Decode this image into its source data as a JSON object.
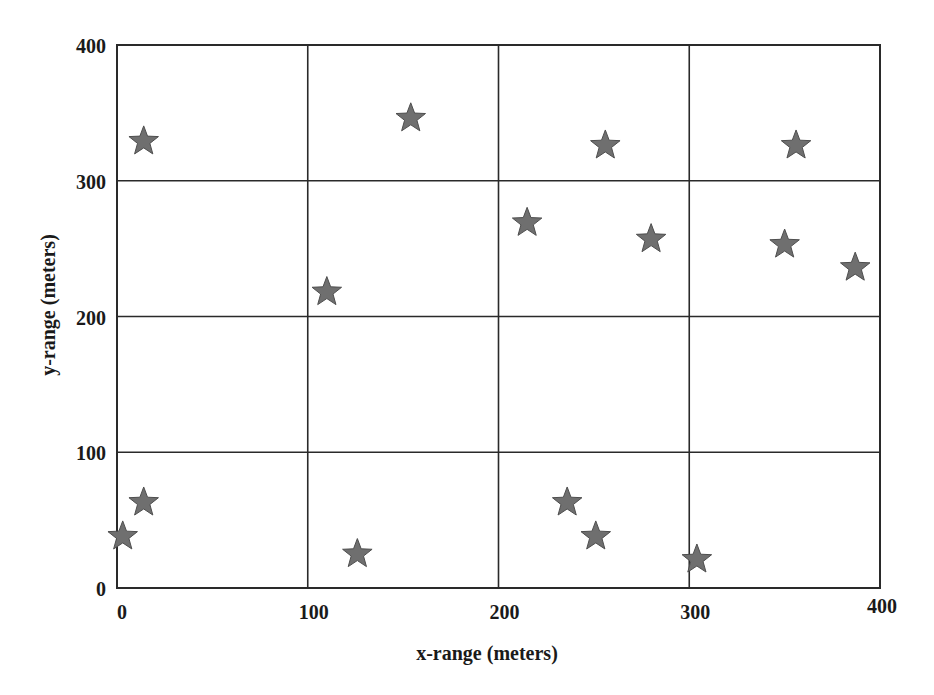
{
  "chart_data": {
    "type": "scatter",
    "title": "",
    "xlabel": "x-range (meters)",
    "ylabel": "y-range (meters)",
    "xlim": [
      0,
      400
    ],
    "ylim": [
      0,
      400
    ],
    "x_ticks": [
      0,
      100,
      200,
      300,
      400
    ],
    "y_ticks": [
      0,
      100,
      200,
      300,
      400
    ],
    "x_tick_labels": [
      "0",
      "100",
      "200",
      "300",
      "400"
    ],
    "y_tick_labels": [
      "0",
      "100",
      "200",
      "300",
      "400"
    ],
    "grid": true,
    "legend": null,
    "marker": "star",
    "marker_color": "#6f6f6f",
    "series": [
      {
        "name": "points",
        "points": [
          {
            "x": 3,
            "y": 38
          },
          {
            "x": 14,
            "y": 63
          },
          {
            "x": 14,
            "y": 329
          },
          {
            "x": 110,
            "y": 218
          },
          {
            "x": 126,
            "y": 25
          },
          {
            "x": 154,
            "y": 346
          },
          {
            "x": 215,
            "y": 269
          },
          {
            "x": 236,
            "y": 63
          },
          {
            "x": 251,
            "y": 38
          },
          {
            "x": 256,
            "y": 326
          },
          {
            "x": 280,
            "y": 257
          },
          {
            "x": 304,
            "y": 21
          },
          {
            "x": 350,
            "y": 253
          },
          {
            "x": 356,
            "y": 326
          },
          {
            "x": 387,
            "y": 236
          }
        ]
      }
    ]
  }
}
